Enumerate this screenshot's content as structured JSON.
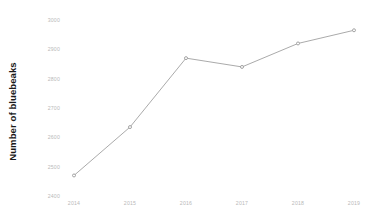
{
  "chart_data": {
    "type": "line",
    "title": "",
    "subtitle": "",
    "xlabel": "",
    "ylabel": "Number of bluebeaks",
    "categories": [
      "2014",
      "2015",
      "2016",
      "2017",
      "2018",
      "2019"
    ],
    "x": [
      2014,
      2015,
      2016,
      2017,
      2018,
      2019
    ],
    "values": [
      2470,
      2635,
      2870,
      2840,
      2920,
      2965
    ],
    "series": [
      {
        "name": "Number of bluebeaks",
        "values": [
          2470,
          2635,
          2870,
          2840,
          2920,
          2965
        ]
      }
    ],
    "ylim": [
      2400,
      3000
    ],
    "yticks": [
      2400,
      2500,
      2600,
      2700,
      2800,
      2900,
      3000
    ],
    "ytick_labels": [
      "2400",
      "2500",
      "2600",
      "2700",
      "2800",
      "2900",
      "3000"
    ],
    "xtick_labels": [
      "2014",
      "2015",
      "2016",
      "2017",
      "2018",
      "2019"
    ],
    "grid": false,
    "legend": false,
    "legend_position": "none",
    "annotations": [],
    "line_color": "#a0a0a0",
    "marker_color": "#8f8f8f",
    "marker_shape": "circle",
    "tick_label_color": "#b9b9b9",
    "axis_title_color": "#1a1a1a",
    "background_color": "#ffffff"
  },
  "axis": {
    "y_title": "Number of bluebeaks"
  }
}
